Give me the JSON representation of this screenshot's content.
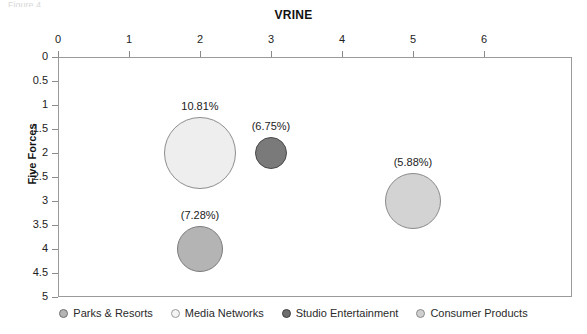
{
  "chart_data": {
    "type": "scatter",
    "title": "VRINE",
    "xlabel": "VRINE",
    "ylabel": "Five Forces",
    "xlim": [
      0,
      7.24
    ],
    "ylim": [
      0,
      5
    ],
    "y_inverted": true,
    "grid": false,
    "legend_position": "bottom",
    "x_ticks": [
      "0",
      "1",
      "2",
      "3",
      "4",
      "5",
      "6"
    ],
    "x_tick_values": [
      0,
      1,
      2,
      3,
      4,
      5,
      6
    ],
    "y_ticks": [
      "0",
      "0.5",
      "1",
      "1.5",
      "2",
      "2.5",
      "3",
      "3.5",
      "4",
      "4.5",
      "5"
    ],
    "y_tick_values": [
      0,
      0.5,
      1,
      1.5,
      2,
      2.5,
      3,
      3.5,
      4,
      4.5,
      5
    ],
    "points": [
      {
        "name": "Media Networks",
        "x": 2,
        "y": 2,
        "size_pct": 10.81,
        "label": "10.81%",
        "fill": "#eeeeee",
        "stroke": "#8d8d8d",
        "radius_px": 36
      },
      {
        "name": "Studio Entertainment",
        "x": 3,
        "y": 2,
        "size_pct": 6.75,
        "label": "(6.75%)",
        "fill": "#7a7a7a",
        "stroke": "#4a4a4a",
        "radius_px": 16
      },
      {
        "name": "Parks & Resorts",
        "x": 2,
        "y": 4,
        "size_pct": 7.28,
        "label": "(7.28%)",
        "fill": "#b4b4b4",
        "stroke": "#7b7b7b",
        "radius_px": 23
      },
      {
        "name": "Consumer Products",
        "x": 5,
        "y": 3,
        "size_pct": 5.88,
        "label": "(5.88%)",
        "fill": "#d3d3d3",
        "stroke": "#8a8a8a",
        "radius_px": 28
      }
    ],
    "legend": [
      {
        "label": "Parks & Resorts",
        "fill": "#b4b4b4",
        "stroke": "#6f6f6f"
      },
      {
        "label": "Media Networks",
        "fill": "#f4f4f4",
        "stroke": "#9a9a9a"
      },
      {
        "label": "Studio Entertainment",
        "fill": "#6e6e6e",
        "stroke": "#3f3f3f"
      },
      {
        "label": "Consumer Products",
        "fill": "#cfcfcf",
        "stroke": "#8a8a8a"
      }
    ],
    "top_clipped_text": "Figure 4"
  }
}
